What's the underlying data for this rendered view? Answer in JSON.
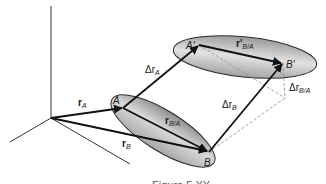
{
  "figure": {
    "caption": "Figure 5.XX",
    "colors": {
      "ellipse_fill_light": "#e6e6e6",
      "ellipse_fill_dark": "#8c8c8c",
      "ellipse_stroke": "#2a2a2a",
      "vector": "#111111",
      "axis": "#333333",
      "dashed": "#8a8a8a"
    },
    "axes": {
      "origin": [
        51,
        118
      ],
      "vertical_end": [
        51,
        6
      ],
      "left_end": [
        10,
        142
      ],
      "right_end": [
        130,
        164
      ]
    },
    "bodies": [
      {
        "name": "initial",
        "cx": 163,
        "cy": 131,
        "rx": 60,
        "ry": 20,
        "rotate": 32
      },
      {
        "name": "displaced",
        "cx": 245,
        "cy": 57,
        "rx": 72,
        "ry": 20,
        "rotate": 6
      }
    ],
    "points": {
      "A": {
        "label": "A",
        "x": 123,
        "y": 108
      },
      "B": {
        "label": "B",
        "x": 209,
        "y": 152
      },
      "A_prime": {
        "label": "A'",
        "x": 199,
        "y": 45
      },
      "B_prime": {
        "label": "B'",
        "x": 283,
        "y": 63
      }
    },
    "labels": {
      "r_A": {
        "main": "r",
        "sub": "A"
      },
      "r_B": {
        "main": "r",
        "sub": "B"
      },
      "r_BA": {
        "main": "r",
        "sub": "B/A"
      },
      "r_BA_prime": {
        "main": "r'",
        "sub": "B/A"
      },
      "delta_r_A": {
        "main": "Δr",
        "sub": "A"
      },
      "delta_r_B": {
        "main": "Δr",
        "sub": "B"
      },
      "delta_r_BA": {
        "main": "Δr",
        "sub": "B/A"
      }
    }
  }
}
